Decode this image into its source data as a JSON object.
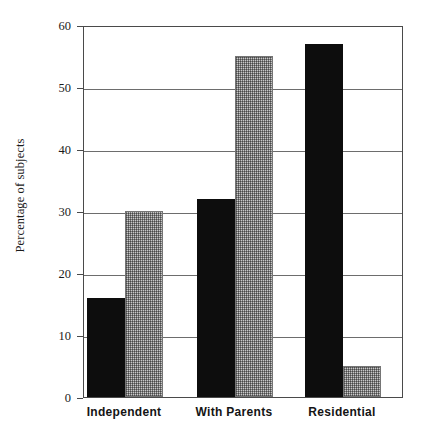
{
  "chart_data": {
    "type": "bar",
    "title": "",
    "xlabel": "",
    "ylabel": "Percentage of subjects",
    "categories": [
      "Independent",
      "With Parents",
      "Residential"
    ],
    "series": [
      {
        "name": "black-series",
        "values": [
          16,
          32,
          57
        ],
        "color": "#0d0d0d",
        "fill": "solid-black"
      },
      {
        "name": "hatched-series",
        "values": [
          30,
          55,
          5
        ],
        "color": "#9a9a9a",
        "fill": "gray-dither"
      }
    ],
    "ylim": [
      0,
      60
    ],
    "yticks": [
      0,
      10,
      20,
      30,
      40,
      50,
      60
    ],
    "ytick_labels": [
      "0",
      "10",
      "20",
      "30",
      "40",
      "50",
      "60"
    ],
    "grid": "horizontal",
    "legend": "none",
    "frame": "box",
    "background": "#ffffff"
  }
}
